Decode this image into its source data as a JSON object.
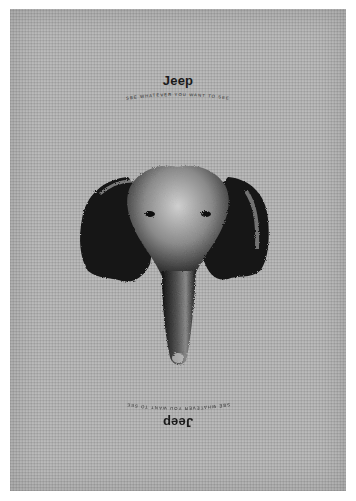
{
  "poster": {
    "brand_top": "Jeep",
    "tagline_top": "SEE WHATEVER YOU WANT TO SEE",
    "brand_bottom": "Jeep",
    "tagline_bottom": "SEE WHATEVER YOU WANT TO SEE",
    "illustration": "elephant-head-icon",
    "background_color": "#b4b4b4",
    "ink_color": "#1a1a1a"
  }
}
